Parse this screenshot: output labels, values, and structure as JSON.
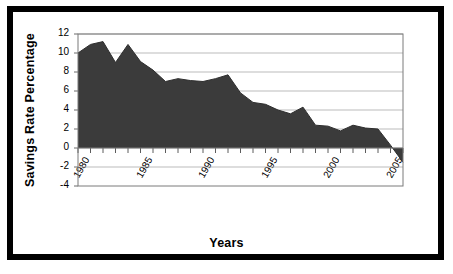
{
  "chart_data": {
    "type": "area",
    "title": "",
    "xlabel": "Years",
    "ylabel": "Savings Rate Percentage",
    "xlim": [
      1980,
      2006
    ],
    "ylim": [
      -4,
      12
    ],
    "y_ticks": [
      12,
      10,
      8,
      6,
      4,
      2,
      0,
      -2,
      -4
    ],
    "x_ticks": [
      1980,
      1985,
      1990,
      1995,
      2000,
      2005
    ],
    "x_tick_labels": [
      "1980",
      "1985",
      "1990",
      "1995",
      "2000",
      "2005"
    ],
    "y_tick_labels": [
      "12",
      "10",
      "8",
      "6",
      "4",
      "2",
      "0",
      "-2",
      "-4"
    ],
    "grid": true,
    "grid_axis": "y",
    "legend": false,
    "series_color": "#3b3b3b",
    "axis_color": "#808080",
    "x": [
      1980,
      1981,
      1982,
      1983,
      1984,
      1985,
      1986,
      1987,
      1988,
      1989,
      1990,
      1991,
      1992,
      1993,
      1994,
      1995,
      1996,
      1997,
      1998,
      1999,
      2000,
      2001,
      2002,
      2003,
      2004,
      2005,
      2006
    ],
    "categories": [
      "1980",
      "1981",
      "1982",
      "1983",
      "1984",
      "1985",
      "1986",
      "1987",
      "1988",
      "1989",
      "1990",
      "1991",
      "1992",
      "1993",
      "1994",
      "1995",
      "1996",
      "1997",
      "1998",
      "1999",
      "2000",
      "2001",
      "2002",
      "2003",
      "2004",
      "2005",
      "2006"
    ],
    "values": [
      10.0,
      10.9,
      11.2,
      9.0,
      10.9,
      9.1,
      8.2,
      7.0,
      7.3,
      7.1,
      7.0,
      7.3,
      7.7,
      5.8,
      4.8,
      4.6,
      4.0,
      3.6,
      4.3,
      2.4,
      2.3,
      1.8,
      2.4,
      2.1,
      2.0,
      0.3,
      -1.5
    ],
    "annotations": []
  },
  "labels": {
    "x_axis_title": "Years",
    "y_axis_title": "Savings Rate Percentage"
  }
}
